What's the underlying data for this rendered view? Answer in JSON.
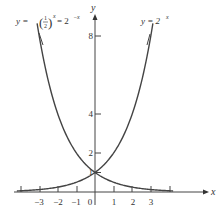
{
  "chart_data": {
    "type": "line",
    "title": "",
    "xlabel": "x",
    "ylabel": "y",
    "xlim": [
      -4.2,
      4.6
    ],
    "ylim": [
      -0.9,
      9.3
    ],
    "x_ticks": [
      -3,
      -2,
      -1,
      0,
      1,
      2,
      3
    ],
    "x_tick_labels": [
      "-3",
      "-2",
      "-1",
      "0",
      "1",
      "2",
      "3"
    ],
    "y_ticks": [
      1,
      2,
      4,
      8
    ],
    "y_tick_labels": [
      "1",
      "2",
      "4",
      "8"
    ],
    "grid": false,
    "series": [
      {
        "name": "y = 2^x",
        "formula": "2^x",
        "x": [
          -4,
          -3,
          -2,
          -1,
          0,
          1,
          2,
          3
        ],
        "values": [
          0.0625,
          0.125,
          0.25,
          0.5,
          1,
          2,
          4,
          8
        ]
      },
      {
        "name": "y = (1/2)^x = 2^-x",
        "formula": "2^-x",
        "x": [
          -3,
          -2,
          -1,
          0,
          1,
          2,
          3,
          4
        ],
        "values": [
          8,
          4,
          2,
          1,
          0.5,
          0.25,
          0.125,
          0.0625
        ]
      }
    ],
    "annotations": [
      {
        "text": "y = (1/2)^x = 2^-x",
        "position": "upper-left"
      },
      {
        "text": "y = 2^x",
        "position": "upper-right"
      }
    ]
  },
  "labels": {
    "x_axis": "x",
    "y_axis": "y",
    "curve_left": {
      "prefix": "y = ",
      "frac_num": "1",
      "frac_den": "2",
      "exp": "x",
      "mid": " = 2",
      "exp2": "−x"
    },
    "curve_right": {
      "prefix": "y = 2",
      "exp": "x"
    },
    "x_ticks": [
      "−3",
      "−2",
      "−1",
      "0",
      "1",
      "2",
      "3"
    ],
    "y_ticks": [
      "1",
      "2",
      "4",
      "8"
    ]
  }
}
